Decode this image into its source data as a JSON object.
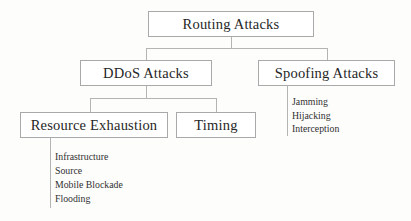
{
  "diagram": {
    "colors": {
      "background": "#fdfdfc",
      "box_border": "#a9a9a9",
      "connector": "#b4b4b4",
      "text": "#262626"
    },
    "nodes": {
      "root": {
        "label": "Routing Attacks"
      },
      "ddos": {
        "label": "DDoS Attacks"
      },
      "spoofing": {
        "label": "Spoofing Attacks"
      },
      "resource": {
        "label": "Resource Exhaustion"
      },
      "timing": {
        "label": "Timing"
      }
    },
    "leaves": {
      "spoofing_children": [
        {
          "label": "Jamming"
        },
        {
          "label": "Hijacking"
        },
        {
          "label": "Interception"
        }
      ],
      "resource_children": [
        {
          "label": "Infrastructure"
        },
        {
          "label": "Source"
        },
        {
          "label": "Mobile Blockade"
        },
        {
          "label": "Flooding"
        }
      ]
    }
  }
}
